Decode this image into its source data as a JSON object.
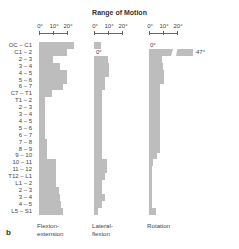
{
  "title": "Range of Motion",
  "panel_label": "b",
  "axis_ticks": [
    "0°",
    "10°",
    "20°"
  ],
  "chart_data": {
    "type": "bar",
    "orientation": "horizontal",
    "title": "Range of Motion",
    "unit": "degrees",
    "axis_range": [
      0,
      20
    ],
    "axis_ticks": [
      0,
      10,
      20
    ],
    "grid": false,
    "categories": [
      "OC – C1",
      "C1 – 2",
      "2 – 3",
      "3 – 4",
      "4 – 5",
      "5 – 6",
      "6 – 7",
      "C7 – T1",
      "T1 – 2",
      "2 – 3",
      "3 – 4",
      "4 – 5",
      "5 – 6",
      "6 – 7",
      "7 – 8",
      "8 – 9",
      "9 – 10",
      "10 – 11",
      "11 – 12",
      "T12 – L1",
      "L1 – 2",
      "2 – 3",
      "3 – 4",
      "4 – 5",
      "L5 – S1"
    ],
    "series": [
      {
        "name": "Flexion-extension",
        "values": [
          25,
          20,
          10,
          15,
          20,
          20,
          17,
          9,
          4,
          4,
          4,
          4,
          4,
          4,
          6,
          6,
          6,
          12,
          12,
          12,
          12,
          14,
          15,
          16,
          17
        ]
      },
      {
        "name": "Lateral-flexion",
        "values": [
          5,
          0,
          10,
          11,
          11,
          8,
          8,
          6,
          6,
          6,
          6,
          6,
          6,
          6,
          6,
          6,
          6,
          9,
          9,
          8,
          6,
          6,
          8,
          6,
          3
        ]
      },
      {
        "name": "Rotation",
        "values": [
          0,
          47,
          9,
          10,
          11,
          11,
          8,
          8,
          8,
          8,
          8,
          8,
          8,
          8,
          8,
          8,
          6,
          3,
          2,
          2,
          2,
          2,
          2,
          2,
          5
        ]
      }
    ],
    "annotations": [
      {
        "series": "Lateral-flexion",
        "category": "C1 – 2",
        "text": "0°"
      },
      {
        "series": "Rotation",
        "category": "OC – C1",
        "text": "0°"
      },
      {
        "series": "Rotation",
        "category": "C1 – 2",
        "text": "47°",
        "note": "bar broken / truncated"
      }
    ]
  },
  "panels": [
    {
      "label": "Flexion-",
      "label2": "extension"
    },
    {
      "label": "Lateral-",
      "label2": "flexion"
    },
    {
      "label": "Rotation",
      "label2": ""
    }
  ],
  "annotations": {
    "lat_c12": "0°",
    "rot_occ1": "0°",
    "rot_c12": "47°"
  }
}
